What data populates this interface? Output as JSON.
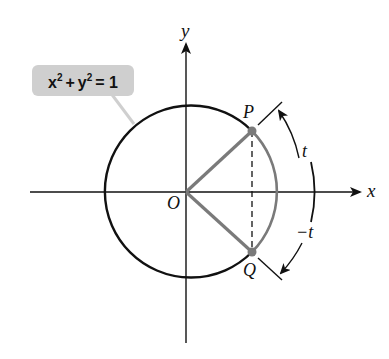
{
  "figure": {
    "type": "unit-circle-diagram",
    "equation_callout": {
      "text": "x² + y² = 1",
      "parts": {
        "x": "x",
        "x_exp": "2",
        "plus": "+",
        "y": "y",
        "y_exp": "2",
        "eq": "= 1"
      },
      "fill": "#cfcfcf"
    },
    "axes": {
      "x_label": "x",
      "y_label": "y",
      "origin_label": "O"
    },
    "points": [
      {
        "label": "P",
        "description": "point on unit circle at arc length t"
      },
      {
        "label": "Q",
        "description": "point on unit circle at arc length -t"
      }
    ],
    "arc_labels": {
      "positive": "t",
      "negative": "−t"
    },
    "colors": {
      "circle": "#111111",
      "axes": "#111111",
      "highlight": "#7a7a7a",
      "callout": "#cfcfcf"
    }
  }
}
